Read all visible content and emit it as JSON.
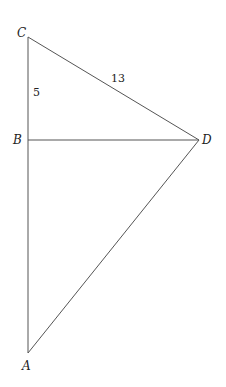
{
  "diagram": {
    "points": {
      "A": {
        "label": "A",
        "x": 28,
        "y": 353
      },
      "B": {
        "label": "B",
        "x": 28,
        "y": 140
      },
      "C": {
        "label": "C",
        "x": 28,
        "y": 37
      },
      "D": {
        "label": "D",
        "x": 199,
        "y": 140
      }
    },
    "segments": [
      {
        "from": "C",
        "to": "A"
      },
      {
        "from": "C",
        "to": "D"
      },
      {
        "from": "B",
        "to": "D"
      },
      {
        "from": "A",
        "to": "D"
      }
    ],
    "measurements": {
      "CB": "5",
      "CD": "13"
    },
    "colors": {
      "line": "#555555",
      "text": "#222222",
      "background": "#ffffff"
    }
  }
}
